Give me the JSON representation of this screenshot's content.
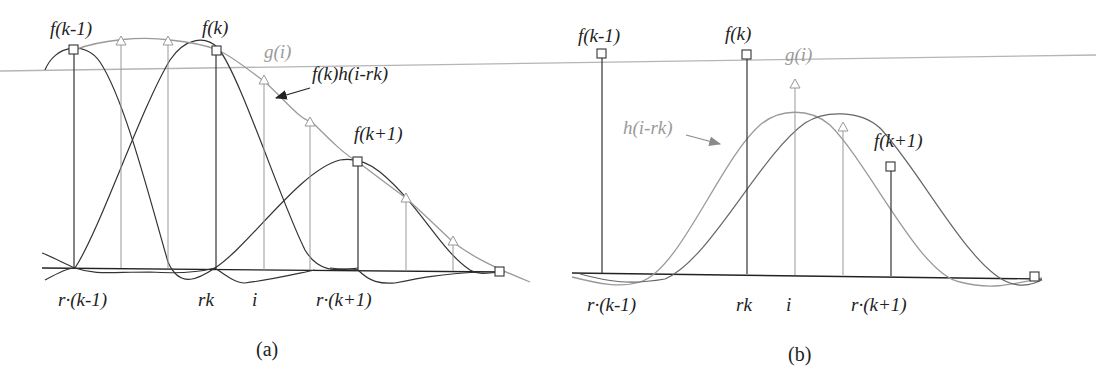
{
  "colors": {
    "dark": "#333333",
    "gray": "#9a9a9a",
    "background": "#ffffff"
  },
  "panel_a": {
    "caption": "(a)",
    "labels": {
      "f_km1": "f(k-1)",
      "f_k": "f(k)",
      "f_kp1": "f(k+1)",
      "g_i": "g(i)",
      "fkh": "f(k)h(i-rk)"
    },
    "axis_labels": {
      "r_km1": "r·(k-1)",
      "rk": "rk",
      "i": "i",
      "r_kp1": "r·(k+1)"
    }
  },
  "panel_b": {
    "caption": "(b)",
    "labels": {
      "f_km1": "f(k-1)",
      "f_k": "f(k)",
      "f_kp1": "f(k+1)",
      "g_i": "g(i)",
      "h": "h(i-rk)"
    },
    "axis_labels": {
      "r_km1": "r·(k-1)",
      "rk": "rk",
      "i": "i",
      "r_kp1": "r·(k+1)"
    }
  }
}
